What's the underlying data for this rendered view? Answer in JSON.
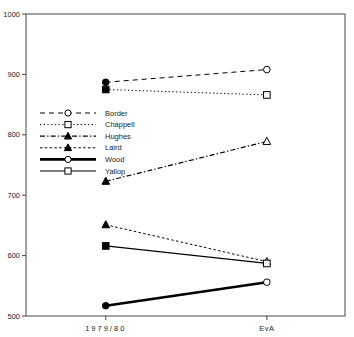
{
  "title": "AUSTRALIAN BATSMEN 1980",
  "chart_data": {
    "type": "line",
    "title": "AUSTRALIAN BATSMEN 1980",
    "xlabel": "",
    "ylabel": "",
    "categories": [
      "1979/80",
      "EvA"
    ],
    "series": [
      {
        "name": "Border",
        "values": [
          887,
          908
        ],
        "line": "dashed",
        "marker": "circle",
        "width": 1
      },
      {
        "name": "Chappell",
        "values": [
          875,
          866
        ],
        "line": "dotted-fine",
        "marker": "square",
        "width": 1
      },
      {
        "name": "Hughes",
        "values": [
          723,
          789
        ],
        "line": "dashdot",
        "marker": "triangle",
        "width": 1.2
      },
      {
        "name": "Laird",
        "values": [
          651,
          590
        ],
        "line": "dotted",
        "marker": "triangle",
        "width": 1
      },
      {
        "name": "Wood",
        "values": [
          517,
          556
        ],
        "line": "solid",
        "marker": "circle",
        "width": 2.6
      },
      {
        "name": "Yallop",
        "values": [
          616,
          587
        ],
        "line": "solid",
        "marker": "square",
        "width": 1.2
      }
    ],
    "ylim": [
      500,
      1000
    ],
    "yticks": [
      1000,
      900,
      800,
      700,
      600,
      500
    ],
    "marker_style": {
      "left": "filled",
      "right": "open"
    },
    "legend_position": "left-middle",
    "grid": "off",
    "colors": {
      "line": "#000000",
      "frame": "#444444",
      "background": "#ffffff",
      "text": "#222222"
    }
  }
}
